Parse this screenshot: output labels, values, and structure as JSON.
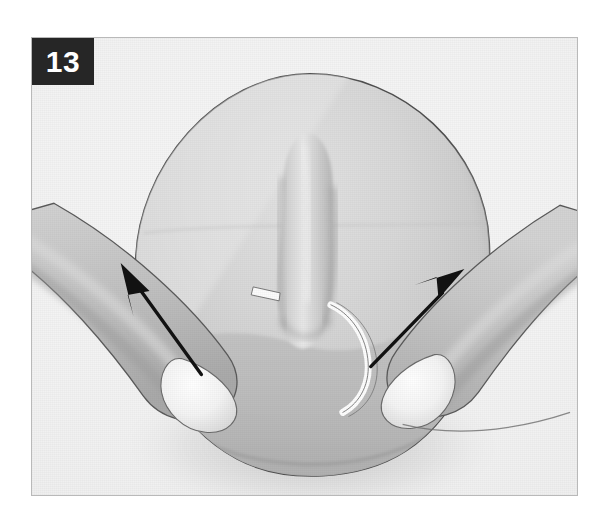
{
  "page": {
    "background_color": "#ffffff",
    "width": 608,
    "height": 521
  },
  "figure": {
    "kind": "instructional-medical-illustration",
    "style": "grayscale line-and-tone drawing",
    "frame": {
      "border_color": "#b9b9b9",
      "background_color": "#f4f4f4",
      "left": 31,
      "top": 37,
      "width": 547,
      "height": 459
    },
    "step_badge": {
      "label": "13",
      "background_color": "#262626",
      "text_color": "#ffffff"
    },
    "scene_description": "Two fingers entering from the lower left and lower right gently retract a rounded body-surface mass; two black arrows point outward and upward indicating the direction of traction.",
    "elements": {
      "dome": {
        "name": "rounded-tissue-dome",
        "outline_color": "#4a4a4a",
        "fill_light": "#dcdcdc",
        "fill_mid": "#cfcfcf",
        "fill_dark": "#bdbdbd",
        "center_x": 310,
        "center_y": 268,
        "radius_x": 176,
        "radius_y": 196
      },
      "central_ridge": {
        "name": "central-vertical-protrusion",
        "highlight_color": "#ebebeb",
        "shadow_color": "#b4b4b4"
      },
      "left_finger": {
        "name": "left-finger",
        "fill_color": "#c6c6c6",
        "nail_color": "#f2f2f2",
        "outline_color": "#555555",
        "direction": "from lower-left toward center"
      },
      "right_finger": {
        "name": "right-finger",
        "fill_color": "#c6c6c6",
        "nail_color": "#f2f2f2",
        "outline_color": "#555555",
        "direction": "from lower-right toward center"
      },
      "left_arrow": {
        "name": "left-traction-arrow",
        "color": "#111111",
        "tail_x": 193,
        "tail_y": 362,
        "head_x": 120,
        "head_y": 262,
        "meaning": "retract tissue up and to the left"
      },
      "right_arrow": {
        "name": "right-traction-arrow",
        "color": "#111111",
        "tail_x": 357,
        "tail_y": 347,
        "head_x": 441,
        "head_y": 267,
        "meaning": "retract tissue up and to the right"
      },
      "incision_line": {
        "name": "white-incision-highlight",
        "color": "#fbfbfb"
      }
    }
  }
}
